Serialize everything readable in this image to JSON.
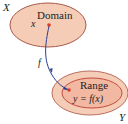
{
  "diagram": {
    "domain_set_label": "X",
    "codomain_set_label": "Y",
    "domain_label": "Domain",
    "range_label": "Range",
    "element_label": "x",
    "function_label": "f",
    "image_label": "y = f(x)"
  },
  "colors": {
    "domain_fill": "#f5cdb6",
    "domain_stroke": "#a8584a",
    "codomain_fill": "#f5cdb6",
    "codomain_stroke": "#b96d5f",
    "range_fill": "#f2b8a2",
    "range_stroke": "#c44b3e",
    "arrow": "#2c3f8f",
    "point": "#d93a2b"
  }
}
